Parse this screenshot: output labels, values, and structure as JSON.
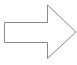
{
  "shape": {
    "type": "right-arrow",
    "stroke_color": "#8a8a8a",
    "fill_color": "#ffffff",
    "background": "#ffffff",
    "points": "4.5,22.5 47.5,22.5 47.5,5 76,32 47.5,58.5 47.5,42.5 4.5,42.5"
  }
}
